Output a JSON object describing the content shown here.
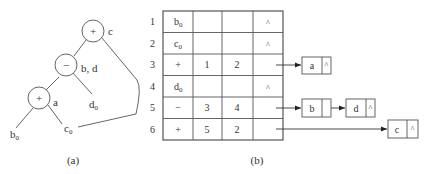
{
  "figure_a": {
    "caption": "(a)",
    "nodes": [
      {
        "id": "n_c",
        "op": "+",
        "label": "c"
      },
      {
        "id": "n_bd",
        "op": "−",
        "label": "b, d"
      },
      {
        "id": "n_a",
        "op": "+",
        "label": "a"
      }
    ],
    "leaves": [
      {
        "id": "b0",
        "text": "b",
        "sub": "0"
      },
      {
        "id": "c0",
        "text": "c",
        "sub": "0"
      },
      {
        "id": "d0",
        "text": "d",
        "sub": "0"
      }
    ]
  },
  "figure_b": {
    "caption": "(b)",
    "rows": [
      {
        "index": "1",
        "c1": "b",
        "c1_sub": "0",
        "c2": "",
        "c3": "",
        "c4": "^"
      },
      {
        "index": "2",
        "c1": "c",
        "c1_sub": "0",
        "c2": "",
        "c3": "",
        "c4": "^"
      },
      {
        "index": "3",
        "c1": "+",
        "c1_sub": "",
        "c2": "1",
        "c3": "2",
        "c4": ""
      },
      {
        "index": "4",
        "c1": "d",
        "c1_sub": "0",
        "c2": "",
        "c3": "",
        "c4": "^"
      },
      {
        "index": "5",
        "c1": "−",
        "c1_sub": "",
        "c2": "3",
        "c3": "4",
        "c4": ""
      },
      {
        "index": "6",
        "c1": "+",
        "c1_sub": "",
        "c2": "5",
        "c3": "2",
        "c4": ""
      }
    ],
    "lists": [
      {
        "row": "3",
        "nodes": [
          {
            "name": "a",
            "next": "^"
          }
        ]
      },
      {
        "row": "5",
        "nodes": [
          {
            "name": "b",
            "next": ""
          },
          {
            "name": "d",
            "next": "^"
          }
        ]
      },
      {
        "row": "6",
        "nodes": [
          {
            "name": "c",
            "next": "^"
          }
        ]
      }
    ]
  }
}
